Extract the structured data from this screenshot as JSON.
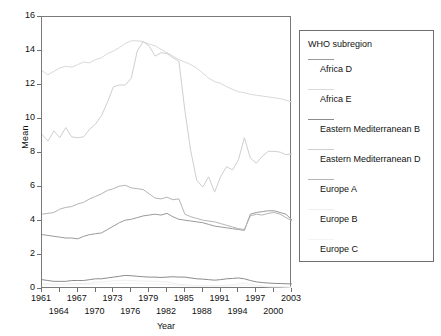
{
  "chart_data": {
    "type": "line",
    "title": "",
    "xlabel": "Year",
    "ylabel": "Mean",
    "xlim": [
      1961,
      2003
    ],
    "ylim": [
      0,
      16
    ],
    "ytick_values": [
      0,
      2,
      4,
      6,
      8,
      10,
      12,
      14,
      16
    ],
    "ytick_labels": [
      "0",
      "2",
      "4",
      "6",
      "8",
      "10",
      "12",
      "14",
      "16"
    ],
    "xtick_labels_row1": [
      "1961",
      "1967",
      "1973",
      "1979",
      "1985",
      "1991",
      "1997",
      "2003"
    ],
    "xtick_values_row1": [
      1961,
      1967,
      1973,
      1979,
      1985,
      1991,
      1997,
      2003
    ],
    "xtick_labels_row2": [
      "1964",
      "1970",
      "1976",
      "1982",
      "1988",
      "1994",
      "2000"
    ],
    "xtick_values_row2": [
      1964,
      1970,
      1976,
      1982,
      1988,
      1994,
      2000
    ],
    "grid": false,
    "legend_position": "right",
    "legend_title": "WHO subregion",
    "x": [
      1961,
      1962,
      1963,
      1964,
      1965,
      1966,
      1967,
      1968,
      1969,
      1970,
      1971,
      1972,
      1973,
      1974,
      1975,
      1976,
      1977,
      1978,
      1979,
      1980,
      1981,
      1982,
      1983,
      1984,
      1985,
      1986,
      1987,
      1988,
      1989,
      1990,
      1991,
      1992,
      1993,
      1994,
      1995,
      1996,
      1997,
      1998,
      1999,
      2000,
      2001,
      2002,
      2003
    ],
    "series": [
      {
        "name": "Africa D",
        "color": "#9a9a9a",
        "values": [
          3.2,
          3.15,
          3.1,
          3.05,
          3.0,
          3.0,
          2.95,
          3.1,
          3.2,
          3.25,
          3.3,
          3.5,
          3.7,
          3.9,
          4.05,
          4.1,
          4.2,
          4.3,
          4.35,
          4.4,
          4.35,
          4.45,
          4.25,
          4.1,
          4.05,
          4.0,
          3.95,
          3.9,
          3.8,
          3.7,
          3.65,
          3.6,
          3.55,
          3.5,
          3.45,
          4.4,
          4.5,
          4.55,
          4.6,
          4.6,
          4.5,
          4.4,
          4.05
        ]
      },
      {
        "name": "Africa E",
        "color": "#d9d9d9",
        "values": [
          12.85,
          12.6,
          12.8,
          13.0,
          13.1,
          13.05,
          13.2,
          13.35,
          13.3,
          13.5,
          13.6,
          13.85,
          14.0,
          14.2,
          14.45,
          14.6,
          14.6,
          14.55,
          14.4,
          14.3,
          14.1,
          13.9,
          13.7,
          13.5,
          13.35,
          13.2,
          13.0,
          12.7,
          12.4,
          12.2,
          12.1,
          11.9,
          11.75,
          11.6,
          11.55,
          11.45,
          11.4,
          11.35,
          11.3,
          11.25,
          11.2,
          11.1,
          11.0
        ]
      },
      {
        "name": "Eastern Mediterranean B",
        "color": "#8c8c8c",
        "values": [
          0.55,
          0.5,
          0.45,
          0.45,
          0.45,
          0.5,
          0.5,
          0.5,
          0.55,
          0.6,
          0.6,
          0.65,
          0.7,
          0.75,
          0.8,
          0.78,
          0.75,
          0.72,
          0.7,
          0.7,
          0.68,
          0.7,
          0.72,
          0.7,
          0.7,
          0.65,
          0.6,
          0.58,
          0.55,
          0.52,
          0.55,
          0.6,
          0.62,
          0.65,
          0.6,
          0.5,
          0.42,
          0.38,
          0.35,
          0.33,
          0.32,
          0.31,
          0.3
        ]
      },
      {
        "name": "Eastern Mediterranean D",
        "color": "#cfcfcf",
        "values": [
          9.1,
          8.7,
          9.3,
          8.9,
          9.5,
          8.95,
          8.9,
          8.95,
          9.4,
          9.7,
          10.2,
          11.0,
          11.9,
          12.0,
          12.0,
          12.4,
          14.0,
          14.55,
          14.3,
          13.7,
          13.9,
          13.85,
          13.6,
          13.4,
          10.5,
          8.1,
          6.4,
          6.0,
          6.6,
          5.7,
          6.6,
          7.2,
          7.0,
          7.6,
          8.9,
          7.7,
          7.4,
          7.8,
          8.1,
          8.1,
          8.05,
          7.9,
          7.95
        ]
      },
      {
        "name": "Europe A",
        "color": "#b5b5b5",
        "values": [
          4.4,
          4.45,
          4.5,
          4.7,
          4.8,
          4.85,
          5.0,
          5.1,
          5.3,
          5.45,
          5.6,
          5.8,
          5.9,
          6.05,
          6.1,
          5.95,
          5.9,
          5.85,
          5.6,
          5.35,
          5.3,
          5.4,
          5.25,
          5.3,
          4.4,
          4.25,
          4.15,
          4.05,
          4.0,
          3.95,
          3.85,
          3.75,
          3.65,
          3.55,
          3.5,
          4.3,
          4.4,
          4.35,
          4.45,
          4.5,
          4.4,
          4.2,
          4.0
        ]
      },
      {
        "name": "Europe B",
        "color": "#efefef",
        "values": [
          0.3,
          0.3,
          0.28,
          0.28,
          0.3,
          0.3,
          0.32,
          0.33,
          0.35,
          0.4,
          0.42,
          0.45,
          0.48,
          0.5,
          0.52,
          0.5,
          0.48,
          0.47,
          0.46,
          0.45,
          0.43,
          0.42,
          0.35,
          0.28,
          0.25,
          0.22,
          0.2,
          0.2,
          0.2,
          0.2,
          0.2,
          0.22,
          0.25,
          0.3,
          0.35,
          0.3,
          0.22,
          0.18,
          0.15,
          0.15,
          0.14,
          0.13,
          0.12
        ]
      },
      {
        "name": "Europe C",
        "color": "#f4f4f4",
        "values": [
          0.25,
          0.24,
          0.23,
          0.23,
          0.24,
          0.24,
          0.25,
          0.26,
          0.27,
          0.28,
          0.3,
          0.3,
          0.31,
          0.32,
          0.32,
          0.31,
          0.3,
          0.3,
          0.29,
          0.29,
          0.28,
          0.27,
          0.25,
          0.22,
          0.2,
          0.18,
          0.17,
          0.16,
          0.16,
          0.16,
          0.16,
          0.17,
          0.18,
          0.2,
          0.22,
          0.2,
          0.17,
          0.15,
          0.13,
          0.12,
          0.12,
          0.11,
          0.1
        ]
      }
    ]
  },
  "legend": {
    "title": "WHO subregion",
    "entries": [
      {
        "label": "Africa D",
        "color": "#9a9a9a"
      },
      {
        "label": "Africa E",
        "color": "#d9d9d9"
      },
      {
        "label": "Eastern Mediterranean B",
        "color": "#8c8c8c"
      },
      {
        "label": "Eastern Mediterranean D",
        "color": "#cfcfcf"
      },
      {
        "label": "Europe A",
        "color": "#b5b5b5"
      },
      {
        "label": "Europe B",
        "color": "#efefef"
      },
      {
        "label": "Europe C",
        "color": "#f4f4f4"
      }
    ]
  }
}
